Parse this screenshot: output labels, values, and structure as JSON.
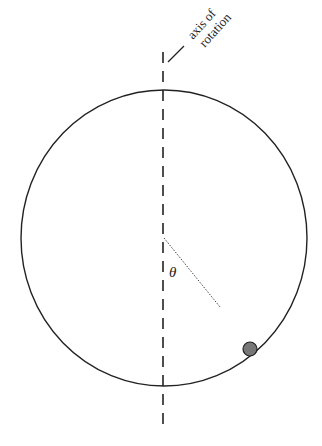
{
  "diagram": {
    "axis_label_line1": "axis of",
    "axis_label_line2": "rotation",
    "angle_label": "θ",
    "colors": {
      "stroke": "#222222",
      "ball_fill": "#777777",
      "background": "#ffffff"
    },
    "elements": [
      "circular hoop",
      "vertical dashed axis of rotation",
      "dotted radius line at angle theta",
      "bead on hoop"
    ]
  }
}
